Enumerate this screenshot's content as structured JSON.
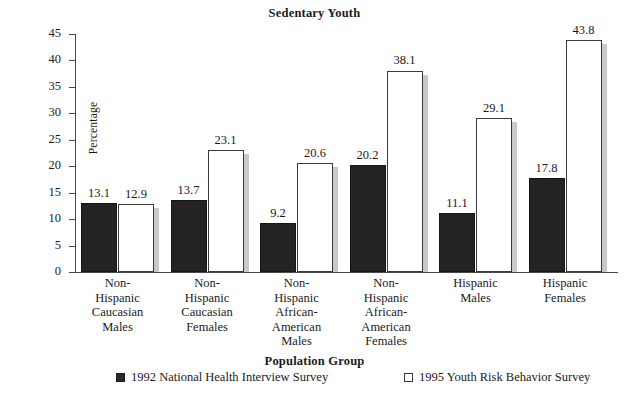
{
  "chart_data": {
    "type": "bar",
    "title": "Sedentary Youth",
    "xlabel": "Population Group",
    "ylabel": "Percentage",
    "ylim": [
      0,
      45
    ],
    "ytick_step": 5,
    "yticks": [
      "45",
      "40",
      "35",
      "30",
      "25",
      "20",
      "15",
      "10",
      "5",
      "0"
    ],
    "grid": false,
    "legend_position": "bottom",
    "categories": [
      "Non-\nHispanic\nCaucasian\nMales",
      "Non-\nHispanic\nCaucasian\nFemales",
      "Non-\nHispanic\nAfrican-\nAmerican\nMales",
      "Non-\nHispanic\nAfrican-\nAmerican\nFemales",
      "Hispanic\nMales",
      "Hispanic\nFemales"
    ],
    "series": [
      {
        "name": "1992 National Health Interview Survey",
        "style": "filled",
        "color": "#232323",
        "values": [
          13.1,
          13.7,
          9.2,
          20.2,
          11.1,
          17.8
        ],
        "labels": [
          "13.1",
          "13.7",
          "9.2",
          "20.2",
          "11.1",
          "17.8"
        ]
      },
      {
        "name": "1995 Youth Risk Behavior Survey",
        "style": "open",
        "color": "#ffffff",
        "values": [
          12.9,
          23.1,
          20.6,
          38.1,
          29.1,
          43.8
        ],
        "labels": [
          "12.9",
          "23.1",
          "20.6",
          "38.1",
          "29.1",
          "43.8"
        ]
      }
    ]
  },
  "legend": {
    "items": [
      {
        "label": "1992 National Health Interview Survey",
        "style": "filled"
      },
      {
        "label": "1995 Youth Risk Behavior Survey",
        "style": "open"
      }
    ]
  }
}
